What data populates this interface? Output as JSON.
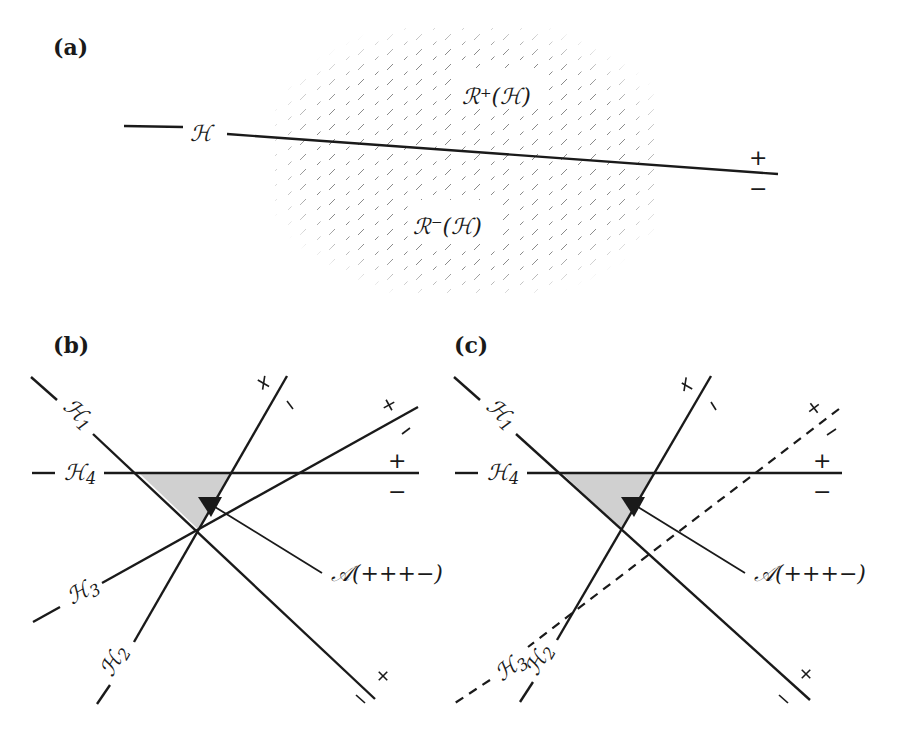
{
  "figure": {
    "panels": [
      {
        "id": "a",
        "label": "(a)",
        "hyperplane_label": "ℋ",
        "region_plus_label": "ℛ⁺(ℋ)",
        "region_minus_label": "ℛ⁻(ℋ)",
        "plus_sign": "+",
        "minus_sign": "−"
      },
      {
        "id": "b",
        "label": "(b)",
        "hyperplanes": [
          {
            "name": "ℋ",
            "sub": "1",
            "style": "solid"
          },
          {
            "name": "ℋ",
            "sub": "2",
            "style": "solid"
          },
          {
            "name": "ℋ",
            "sub": "3",
            "style": "solid"
          },
          {
            "name": "ℋ",
            "sub": "4",
            "style": "solid"
          }
        ],
        "region_label": "𝒜(+++−)",
        "plus_sign": "+",
        "minus_sign": "−"
      },
      {
        "id": "c",
        "label": "(c)",
        "hyperplanes": [
          {
            "name": "ℋ",
            "sub": "1",
            "style": "solid"
          },
          {
            "name": "ℋ",
            "sub": "2",
            "style": "solid"
          },
          {
            "name": "ℋ",
            "sub": "3",
            "style": "dashed"
          },
          {
            "name": "ℋ",
            "sub": "4",
            "style": "solid"
          }
        ],
        "region_label": "𝒜(+++−)",
        "plus_sign": "+",
        "minus_sign": "−"
      }
    ],
    "colors": {
      "ink": "#1a1a1a",
      "shade": "#d0d0d0",
      "hatch": "#8a8a8a"
    }
  }
}
